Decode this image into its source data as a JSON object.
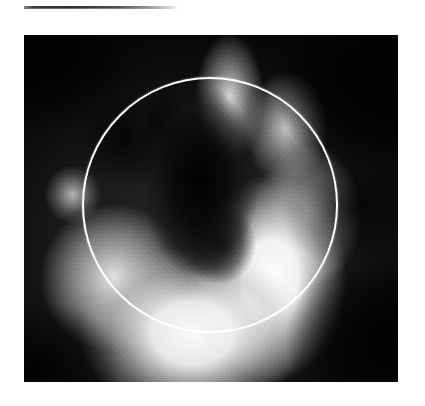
{
  "page": {
    "background_color": "#ffffff",
    "width": 425,
    "height": 406
  },
  "top_rule": {
    "name": "horizontal-rule",
    "left": 24,
    "top": 6,
    "width": 155,
    "height": 3,
    "style": "tapered dark-to-white gradient line",
    "color_dark": "#2e2e2e",
    "color_light": "#ffffff"
  },
  "figure": {
    "caption": "",
    "modality": "nuclear medicine scintigram (grayscale planar scan)",
    "left": 24,
    "top": 35,
    "width": 374,
    "height": 347,
    "background_color": "#0a0a0a",
    "colormap": "grayscale",
    "overlay": {
      "type": "circle",
      "name": "region-of-interest-circle",
      "stroke_color": "#ffffff",
      "stroke_width": 2,
      "center_x": 210,
      "center_y": 205,
      "radius": 128,
      "bbox": [
        82,
        77,
        338,
        333
      ]
    },
    "features": [
      {
        "name": "bright-uptake-horseshoe",
        "description": "crescent of high tracer uptake spanning the inferior, right-lateral and superior-right walls, open toward the upper-left",
        "intensity": "high (near white)"
      },
      {
        "name": "central-dark-cavity",
        "description": "elongated low-count band running diagonally from upper-left to the centre of the circle",
        "intensity": "low (near black)"
      },
      {
        "name": "dark-background-field",
        "description": "noisy near-black background surrounding the organ, strongest at the image corners",
        "intensity": "very low"
      },
      {
        "name": "left-shoulder-blob",
        "description": "small isolated area of moderate uptake outside the circle on the left edge",
        "intensity": "moderate"
      }
    ]
  }
}
